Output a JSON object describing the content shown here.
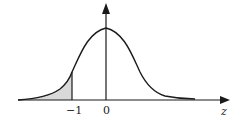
{
  "diagram": {
    "axis_label_x": "z",
    "tick_labels": [
      "−1",
      "0"
    ],
    "shaded_region": "z < −1",
    "colors": {
      "curve": "#1a1a1a",
      "axis": "#1a1a1a",
      "shade": "#d9d9d9"
    }
  }
}
